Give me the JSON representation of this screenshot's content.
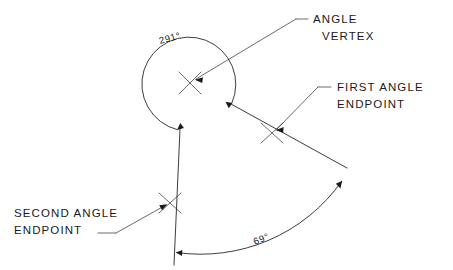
{
  "diagram": {
    "background_color": "#ffffff",
    "line_color": "#1a1a1a",
    "dimensions": {
      "reflex_angle": {
        "value": "291°",
        "numeric": 291,
        "position": "upper-left of vertex"
      },
      "included_angle": {
        "value": "69°",
        "numeric": 69,
        "position": "lower-right between rays"
      }
    },
    "annotations": [
      {
        "id": "angle-vertex",
        "line1": "ANGLE",
        "line2": "VERTEX",
        "target": "vertex cross marker"
      },
      {
        "id": "first-angle-endpoint",
        "line1": "FIRST ANGLE",
        "line2": "ENDPOINT",
        "target": "first ray endpoint cross marker"
      },
      {
        "id": "second-angle-endpoint",
        "line1": "SECOND ANGLE",
        "line2": "ENDPOINT",
        "target": "second ray endpoint cross marker"
      }
    ],
    "markers": {
      "vertex_label": "X",
      "first_endpoint_label": "X",
      "second_endpoint_label": "X"
    }
  }
}
